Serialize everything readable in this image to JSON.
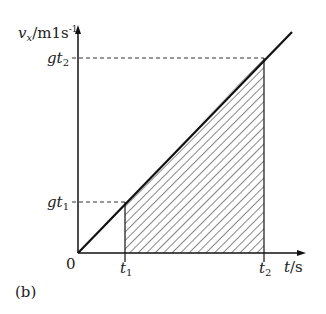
{
  "figure": {
    "panel_label": "(b)",
    "y_axis_label": {
      "var": "v",
      "sub": "x",
      "unit": "/m1s",
      "sup": "-1"
    },
    "x_axis_label": {
      "var": "t",
      "unit": "/s"
    },
    "origin_label": "0",
    "y_ticks": [
      {
        "base": "gt",
        "sub": "1"
      },
      {
        "base": "gt",
        "sub": "2"
      }
    ],
    "x_ticks": [
      {
        "base": "t",
        "sub": "1"
      },
      {
        "base": "t",
        "sub": "2"
      }
    ],
    "colors": {
      "line": "#1a1a1a",
      "hatch": "#555555",
      "dashed": "#333333"
    }
  }
}
